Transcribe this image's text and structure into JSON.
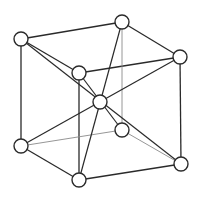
{
  "diagram": {
    "type": "body-centered-cubic-unit-cell",
    "colors": {
      "line": "#2a2a2a",
      "hidden_line": "#8a8a8a",
      "atom_fill": "#ffffff",
      "atom_stroke": "#2a2a2a",
      "background": "#ffffff"
    },
    "atom_radius": 7,
    "atoms": [
      {
        "id": "top-back-left",
        "x": 21,
        "y": 39
      },
      {
        "id": "top-back-right",
        "x": 122,
        "y": 22
      },
      {
        "id": "top-front-right",
        "x": 180,
        "y": 57
      },
      {
        "id": "top-front-left",
        "x": 79,
        "y": 73
      },
      {
        "id": "body-center",
        "x": 100,
        "y": 102
      },
      {
        "id": "bottom-back-left",
        "x": 21,
        "y": 146
      },
      {
        "id": "bottom-back-right",
        "x": 122,
        "y": 130
      },
      {
        "id": "bottom-front-right",
        "x": 181,
        "y": 164
      },
      {
        "id": "bottom-front-left",
        "x": 79,
        "y": 180
      }
    ],
    "edges": [
      {
        "from": "top-back-left",
        "to": "top-back-right",
        "hidden": false
      },
      {
        "from": "top-back-right",
        "to": "top-front-right",
        "hidden": false
      },
      {
        "from": "top-front-right",
        "to": "top-front-left",
        "hidden": false
      },
      {
        "from": "top-front-left",
        "to": "top-back-left",
        "hidden": false
      },
      {
        "from": "top-back-left",
        "to": "bottom-back-left",
        "hidden": false
      },
      {
        "from": "top-front-left",
        "to": "bottom-front-left",
        "hidden": false
      },
      {
        "from": "top-front-right",
        "to": "bottom-front-right",
        "hidden": false
      },
      {
        "from": "top-back-right",
        "to": "bottom-back-right",
        "hidden": true
      },
      {
        "from": "bottom-back-left",
        "to": "bottom-front-left",
        "hidden": false
      },
      {
        "from": "bottom-front-left",
        "to": "bottom-front-right",
        "hidden": false
      },
      {
        "from": "bottom-back-left",
        "to": "bottom-back-right",
        "hidden": true
      },
      {
        "from": "bottom-back-right",
        "to": "bottom-front-right",
        "hidden": true
      }
    ],
    "body_diagonals": [
      {
        "from": "top-back-left",
        "to": "bottom-front-right"
      },
      {
        "from": "top-back-right",
        "to": "bottom-front-left"
      },
      {
        "from": "top-front-right",
        "to": "bottom-back-left"
      },
      {
        "from": "top-front-left",
        "to": "bottom-back-right"
      }
    ]
  }
}
